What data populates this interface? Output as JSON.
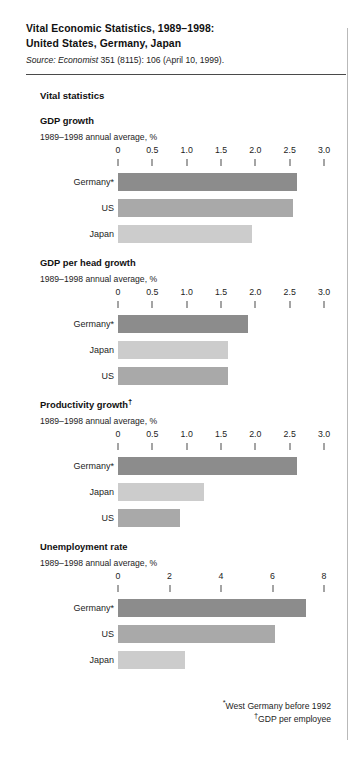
{
  "header": {
    "title_line1": "Vital Economic Statistics, 1989–1998:",
    "title_line2": "United States, Germany, Japan",
    "source_prefix": "Source:",
    "source_italic": "Economist",
    "source_rest": " 351 (8115): 106 (April 10, 1999)."
  },
  "section": {
    "title": "Vital statistics"
  },
  "footnotes": {
    "note1_marker": "*",
    "note1": "West Germany before 1992",
    "note2_marker": "†",
    "note2": "GDP per employee"
  },
  "colors": {
    "bar_dark": "#8c8c8c",
    "bar_mid": "#a9a9a9",
    "bar_light": "#cccccc",
    "rule": "#4a4a4a",
    "text": "#1d1d1d"
  },
  "chart_data": [
    {
      "type": "bar",
      "orientation": "horizontal",
      "title": "GDP growth",
      "title_dagger": "",
      "subtitle": "1989–1998 annual average, %",
      "xlabel": "",
      "ylabel": "",
      "xlim": [
        0,
        3.0
      ],
      "xticks": [
        0,
        0.5,
        1.0,
        1.5,
        2.0,
        2.5,
        3.0
      ],
      "xticklabels": [
        "0",
        "0.5",
        "1.0",
        "1.5",
        "2.0",
        "2.5",
        "3.0"
      ],
      "grid": false,
      "legend": "none",
      "categories": [
        "Germany*",
        "US",
        "Japan"
      ],
      "values": [
        2.6,
        2.55,
        1.95
      ],
      "shades": [
        "dark",
        "mid",
        "light"
      ]
    },
    {
      "type": "bar",
      "orientation": "horizontal",
      "title": "GDP per head growth",
      "title_dagger": "",
      "subtitle": "1989–1998 annual average, %",
      "xlabel": "",
      "ylabel": "",
      "xlim": [
        0,
        3.0
      ],
      "xticks": [
        0,
        0.5,
        1.0,
        1.5,
        2.0,
        2.5,
        3.0
      ],
      "xticklabels": [
        "0",
        "0.5",
        "1.0",
        "1.5",
        "2.0",
        "2.5",
        "3.0"
      ],
      "grid": false,
      "legend": "none",
      "categories": [
        "Germany*",
        "Japan",
        "US"
      ],
      "values": [
        1.9,
        1.6,
        1.6
      ],
      "shades": [
        "dark",
        "light",
        "mid"
      ]
    },
    {
      "type": "bar",
      "orientation": "horizontal",
      "title": "Productivity growth",
      "title_dagger": "†",
      "subtitle": "1989–1998 annual average, %",
      "xlabel": "",
      "ylabel": "",
      "xlim": [
        0,
        3.0
      ],
      "xticks": [
        0,
        0.5,
        1.0,
        1.5,
        2.0,
        2.5,
        3.0
      ],
      "xticklabels": [
        "0",
        "0.5",
        "1.0",
        "1.5",
        "2.0",
        "2.5",
        "3.0"
      ],
      "grid": false,
      "legend": "none",
      "categories": [
        "Germany*",
        "Japan",
        "US"
      ],
      "values": [
        2.6,
        1.25,
        0.9
      ],
      "shades": [
        "dark",
        "light",
        "mid"
      ]
    },
    {
      "type": "bar",
      "orientation": "horizontal",
      "title": "Unemployment rate",
      "title_dagger": "",
      "subtitle": "1989–1998 annual average, %",
      "xlabel": "",
      "ylabel": "",
      "xlim": [
        0,
        8
      ],
      "xticks": [
        0,
        2,
        4,
        6,
        8
      ],
      "xticklabels": [
        "0",
        "2",
        "4",
        "6",
        "8"
      ],
      "grid": false,
      "legend": "none",
      "categories": [
        "Germany*",
        "US",
        "Japan"
      ],
      "values": [
        7.3,
        6.1,
        2.6
      ],
      "shades": [
        "dark",
        "mid",
        "light"
      ]
    }
  ]
}
